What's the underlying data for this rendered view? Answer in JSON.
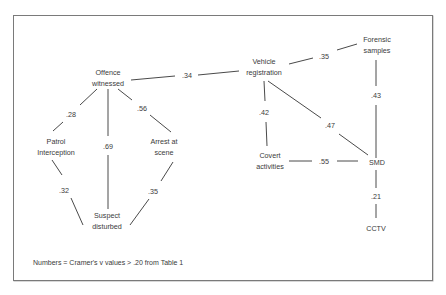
{
  "diagram": {
    "type": "association-network",
    "nodes": [
      {
        "id": "offence_witnessed",
        "label": [
          "Offence",
          "witnessed"
        ]
      },
      {
        "id": "patrol_interception",
        "label": [
          "Patrol",
          "Interception"
        ]
      },
      {
        "id": "arrest_at_scene",
        "label": [
          "Arrest at",
          "scene"
        ]
      },
      {
        "id": "suspect_disturbed",
        "label": [
          "Suspect",
          "disturbed"
        ]
      },
      {
        "id": "vehicle_registration",
        "label": [
          "Vehicle",
          "registration"
        ]
      },
      {
        "id": "forensic_samples",
        "label": [
          "Forensic",
          "samples"
        ]
      },
      {
        "id": "covert_activities",
        "label": [
          "Covert",
          "activities"
        ]
      },
      {
        "id": "smd",
        "label": [
          "SMD"
        ]
      },
      {
        "id": "cctv",
        "label": [
          "CCTV"
        ]
      }
    ],
    "edges": [
      {
        "from": "offence_witnessed",
        "to": "vehicle_registration",
        "value": ".34"
      },
      {
        "from": "offence_witnessed",
        "to": "patrol_interception",
        "value": ".28"
      },
      {
        "from": "offence_witnessed",
        "to": "suspect_disturbed",
        "value": ".69"
      },
      {
        "from": "offence_witnessed",
        "to": "arrest_at_scene",
        "value": ".56"
      },
      {
        "from": "patrol_interception",
        "to": "suspect_disturbed",
        "value": ".32"
      },
      {
        "from": "arrest_at_scene",
        "to": "suspect_disturbed",
        "value": ".35"
      },
      {
        "from": "vehicle_registration",
        "to": "forensic_samples",
        "value": ".35"
      },
      {
        "from": "vehicle_registration",
        "to": "covert_activities",
        "value": ".42"
      },
      {
        "from": "vehicle_registration",
        "to": "smd",
        "value": ".47"
      },
      {
        "from": "forensic_samples",
        "to": "smd",
        "value": ".43"
      },
      {
        "from": "covert_activities",
        "to": "smd",
        "value": ".55"
      },
      {
        "from": "smd",
        "to": "cctv",
        "value": ".21"
      }
    ],
    "note": "Numbers = Cramer's v values > .20 from Table 1"
  }
}
